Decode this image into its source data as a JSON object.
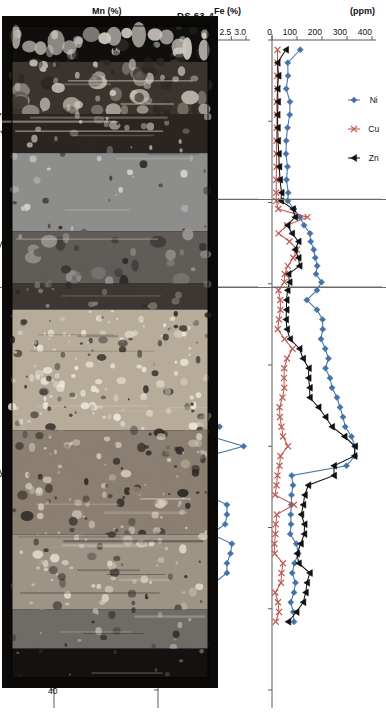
{
  "figure": {
    "sample_label": "DS 63-4",
    "caption": "Distribution of Ni, Cu, Zn in the Mn crust DS 63-4 (modified after Izokh 1991). Type I Mn crusts are characterized by"
  },
  "axis": {
    "x_title": "(mm)",
    "x_ticks": [
      0,
      5,
      10,
      15,
      20,
      25,
      30,
      35,
      40
    ],
    "x_min": 0,
    "x_max": 40
  },
  "zones": {
    "boundaries_mm": [
      9.8,
      15.2
    ],
    "labels": [
      {
        "name": "Type III",
        "center_mm": 4.6
      },
      {
        "name": "Type II",
        "center_mm": 12.5
      },
      {
        "name": "Type I",
        "center_mm": 26.5
      }
    ]
  },
  "legend": {
    "entries": [
      {
        "label": "Ni",
        "color": "#4473a8",
        "marker": "diamond"
      },
      {
        "label": "Cu",
        "color": "#bd5a53",
        "marker": "cross"
      },
      {
        "label": "Zn",
        "color": "#111111",
        "marker": "triangle"
      }
    ]
  },
  "chart_data": [
    {
      "type": "line",
      "id": "trace-metals",
      "title": "",
      "xlabel": "(mm)",
      "ylabel": "(ppm)",
      "xlim": [
        0,
        40
      ],
      "ylim": [
        0,
        400
      ],
      "yticks": [
        0,
        100,
        200,
        300,
        400
      ],
      "grid": false,
      "legend_position": "top-left",
      "x": [
        0.6,
        1.4,
        2.2,
        3.0,
        3.8,
        4.6,
        5.4,
        6.2,
        7.0,
        7.8,
        8.6,
        9.4,
        9.9,
        10.4,
        10.9,
        11.4,
        11.9,
        12.4,
        12.9,
        13.4,
        13.9,
        14.4,
        14.9,
        15.4,
        16.0,
        16.6,
        17.2,
        17.8,
        18.4,
        19.0,
        19.6,
        20.2,
        20.8,
        21.4,
        22.0,
        22.6,
        23.2,
        23.8,
        24.4,
        25.0,
        25.6,
        26.2,
        26.8,
        27.4,
        28.0,
        28.6,
        29.2,
        29.8,
        30.4,
        31.0,
        31.6,
        32.2,
        32.8,
        33.4,
        34.0,
        34.6,
        35.2,
        35.8
      ],
      "series": [
        {
          "name": "Ni",
          "color": "#4473a8",
          "values": [
            113,
            63,
            64,
            57,
            72,
            71,
            62,
            57,
            56,
            62,
            58,
            65,
            63,
            88,
            112,
            128,
            152,
            155,
            167,
            173,
            181,
            176,
            198,
            180,
            139,
            180,
            202,
            203,
            196,
            213,
            226,
            214,
            232,
            240,
            260,
            272,
            284,
            293,
            318,
            331,
            331,
            298,
            79,
            84,
            78,
            77,
            75,
            76,
            73,
            97,
            105,
            90,
            81,
            94,
            88,
            75,
            85,
            88
          ]
        },
        {
          "name": "Cu",
          "color": "#bd5a53",
          "values": [
            22,
            22,
            21,
            22,
            19,
            20,
            19,
            18,
            18,
            18,
            17,
            17,
            17,
            25,
            142,
            60,
            26,
            70,
            100,
            85,
            63,
            51,
            49,
            26,
            33,
            34,
            28,
            23,
            50,
            82,
            60,
            49,
            48,
            49,
            42,
            30,
            32,
            38,
            44,
            64,
            34,
            30,
            22,
            18,
            12,
            88,
            19,
            15,
            14,
            10,
            11,
            44,
            38,
            36,
            13,
            24,
            28,
            15
          ]
        },
        {
          "name": "Zn",
          "color": "#111111",
          "values": [
            56,
            22,
            26,
            22,
            24,
            22,
            23,
            24,
            27,
            29,
            32,
            38,
            36,
            84,
            92,
            62,
            80,
            106,
            92,
            106,
            110,
            66,
            70,
            62,
            58,
            58,
            56,
            60,
            72,
            110,
            124,
            147,
            146,
            151,
            151,
            186,
            214,
            240,
            290,
            332,
            330,
            248,
            248,
            145,
            131,
            125,
            117,
            130,
            129,
            115,
            100,
            107,
            151,
            140,
            135,
            125,
            98,
            65
          ]
        }
      ]
    },
    {
      "type": "line",
      "id": "iron",
      "title": "",
      "xlabel": "(mm)",
      "ylabel": "Fe (%)",
      "xlim": [
        0,
        40
      ],
      "ylim": [
        0,
        3.0
      ],
      "yticks": [
        0.0,
        0.5,
        1.0,
        1.5,
        2.0,
        2.5,
        3.0
      ],
      "grid": false,
      "series": [
        {
          "name": "Fe",
          "color": "#4473a8",
          "x": [
            0.6,
            1.4,
            2.2,
            3.0,
            3.8,
            4.6,
            5.4,
            6.2,
            7.0,
            7.8,
            8.6,
            9.4,
            9.9,
            10.4,
            10.9,
            11.4,
            11.9,
            12.4,
            12.9,
            13.4,
            13.9,
            14.4,
            14.9,
            15.4,
            16.0,
            16.6,
            17.2,
            17.8,
            18.4,
            19.0,
            19.6,
            20.2,
            20.8,
            21.4,
            22.0,
            22.6,
            23.2,
            23.8,
            24.4,
            25.0,
            25.6,
            26.2,
            26.8,
            27.4,
            28.0,
            28.6,
            29.2,
            29.8,
            30.4,
            31.0,
            31.6,
            32.2,
            32.8,
            33.4,
            34.0,
            34.6
          ],
          "values": [
            0.03,
            0.03,
            0.03,
            0.03,
            0.04,
            0.04,
            0.04,
            0.04,
            0.04,
            0.04,
            0.04,
            0.04,
            0.04,
            0.12,
            0.3,
            0.33,
            0.62,
            0.92,
            0.95,
            1.0,
            1.04,
            1.06,
            1.08,
            1.12,
            1.16,
            1.44,
            1.44,
            1.44,
            1.21,
            1.44,
            1.65,
            1.55,
            1.55,
            1.58,
            1.7,
            1.8,
            1.8,
            2.1,
            1.81,
            2.92,
            1.72,
            1.7,
            1.47,
            1.55,
            1.68,
            2.35,
            2.35,
            2.29,
            1.81,
            2.52,
            2.47,
            2.35,
            2.35,
            1.92,
            1.38,
            1.38
          ]
        }
      ]
    },
    {
      "type": "line",
      "id": "manganese",
      "title": "",
      "xlabel": "(mm)",
      "ylabel": "Mn (%)",
      "xlim": [
        0,
        40
      ],
      "ylim": [
        15,
        55
      ],
      "yticks": [
        15,
        20,
        25,
        30,
        35,
        40,
        45,
        50,
        55
      ],
      "grid": false,
      "series": [
        {
          "name": "Mn",
          "color": "#4473a8",
          "x": [
            0.6,
            1.4,
            2.2,
            3.0,
            3.8,
            4.6,
            5.4,
            6.2,
            7.0,
            7.8,
            8.6,
            9.4,
            9.9,
            10.6,
            11.4,
            12.2,
            12.9,
            13.6,
            14.3,
            15.2,
            15.9,
            16.6,
            17.3,
            18.0,
            18.7,
            19.4,
            20.1,
            20.8,
            21.5,
            22.2,
            22.9,
            23.6,
            24.3,
            25.0,
            25.7,
            26.4,
            27.1,
            27.8,
            28.5,
            29.2,
            29.9,
            30.6,
            31.3,
            32.0,
            32.7,
            33.4,
            34.1,
            34.8,
            35.5
          ],
          "values": [
            49.4,
            48.0,
            46.2,
            48.6,
            48.6,
            44.4,
            48.2,
            45.8,
            48.6,
            48.6,
            48.6,
            48.6,
            47.0,
            30.8,
            37.0,
            43.2,
            39.6,
            33.6,
            25.0,
            16.8,
            16.4,
            17.6,
            18.6,
            20.0,
            21.8,
            20.4,
            21.0,
            22.4,
            23.8,
            22.4,
            23.0,
            23.2,
            22.6,
            22.0,
            20.6,
            16.6,
            20.2,
            21.4,
            23.2,
            18.4,
            23.4,
            19.2,
            19.0,
            21.6,
            21.0,
            19.4,
            19.0,
            18.8,
            18.8
          ]
        }
      ]
    }
  ]
}
